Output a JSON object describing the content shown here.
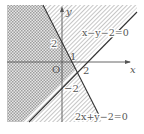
{
  "diagram": {
    "type": "linear-inequality-regions",
    "axes": {
      "x_label": "x",
      "y_label": "y",
      "origin_label": "O"
    },
    "ticks": {
      "y_pos": "2",
      "x_one": "1",
      "x_two": "2",
      "y_neg": "−2"
    },
    "lines": [
      {
        "id": "line1",
        "equation": "x−y−2=0",
        "eq_parts": [
          "x",
          "−",
          "y",
          "−2=0"
        ]
      },
      {
        "id": "line2",
        "equation": "2x+y−2=0",
        "eq_parts": [
          "2",
          "x",
          "+",
          "y",
          "−2=0"
        ]
      }
    ],
    "regions": [
      {
        "name": "left-of-2x+y-2",
        "pattern": "checker"
      },
      {
        "name": "above-x-y-2",
        "pattern": "diagonal-hatch"
      },
      {
        "name": "below-x-y-2-right-of-2x+y-2",
        "pattern": "diagonal-hatch"
      }
    ],
    "colors": {
      "line": "#333333",
      "axis": "#555555",
      "hatch": "#9a9a9a",
      "checker_dark": "#a8a8a8",
      "checker_light": "#e6e6e6"
    }
  }
}
